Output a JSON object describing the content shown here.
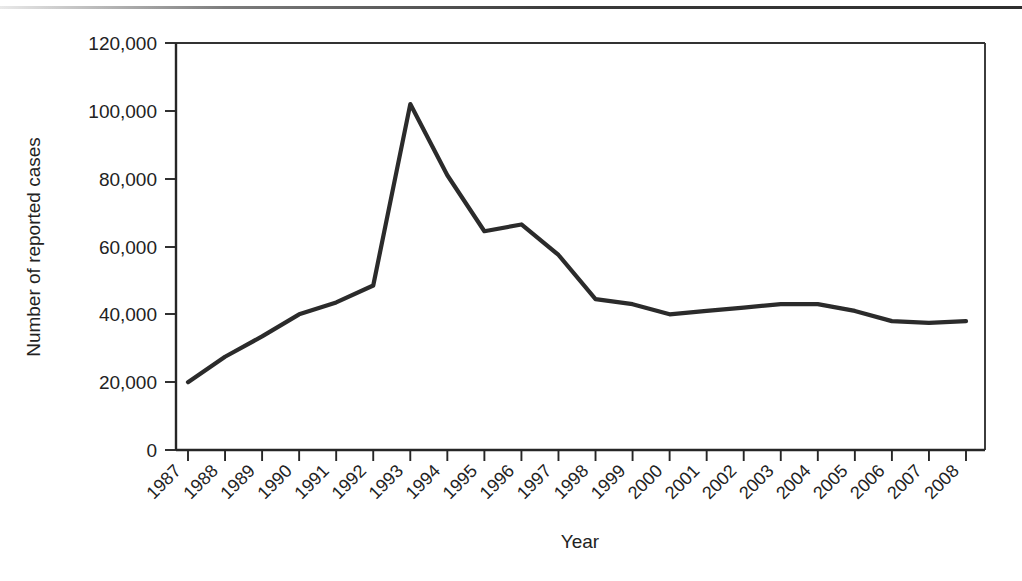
{
  "figure": {
    "name": "reported-cases-by-year-line-chart"
  },
  "chart_data": {
    "type": "line",
    "title": "",
    "subtitle": "",
    "xlabel": "Year",
    "ylabel": "Number of reported cases",
    "categories": [
      "1987",
      "1988",
      "1989",
      "1990",
      "1991",
      "1992",
      "1993",
      "1994",
      "1995",
      "1996",
      "1997",
      "1998",
      "1999",
      "2000",
      "2001",
      "2002",
      "2003",
      "2004",
      "2005",
      "2006",
      "2007",
      "2008"
    ],
    "values": [
      20000,
      27500,
      33500,
      40000,
      43500,
      48500,
      102000,
      81000,
      64500,
      66500,
      57500,
      44500,
      43000,
      40000,
      41000,
      42000,
      43000,
      43000,
      41000,
      38000,
      37500,
      38000
    ],
    "series": [
      {
        "name": "Number of reported cases",
        "values": [
          20000,
          27500,
          33500,
          40000,
          43500,
          48500,
          102000,
          81000,
          64500,
          66500,
          57500,
          44500,
          43000,
          40000,
          41000,
          42000,
          43000,
          43000,
          41000,
          38000,
          37500,
          38000
        ]
      }
    ],
    "x": [
      "1987",
      "1988",
      "1989",
      "1990",
      "1991",
      "1992",
      "1993",
      "1994",
      "1995",
      "1996",
      "1997",
      "1998",
      "1999",
      "2000",
      "2001",
      "2002",
      "2003",
      "2004",
      "2005",
      "2006",
      "2007",
      "2008"
    ],
    "ylim": [
      0,
      120000
    ],
    "ytick_values": [
      0,
      20000,
      40000,
      60000,
      80000,
      100000,
      120000
    ],
    "ytick_labels": [
      "0",
      "20,000",
      "40,000",
      "60,000",
      "80,000",
      "100,000",
      "120,000"
    ],
    "xtick_labels": [
      "1987",
      "1988",
      "1989",
      "1990",
      "1991",
      "1992",
      "1993",
      "1994",
      "1995",
      "1996",
      "1997",
      "1998",
      "1999",
      "2000",
      "2001",
      "2002",
      "2003",
      "2004",
      "2005",
      "2006",
      "2007",
      "2008"
    ],
    "grid": false,
    "legend": false,
    "legend_position": "none",
    "line_color": "#2b2b2b",
    "annotations": []
  },
  "colors": {
    "line": "#2b2b2b",
    "axis": "#262626",
    "text": "#222222",
    "background": "#ffffff"
  }
}
